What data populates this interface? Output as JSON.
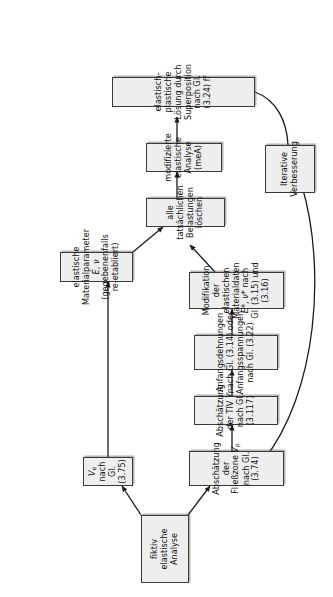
{
  "diagram": {
    "orientation": "rotated-90-ccw",
    "background_color": "#ffffff",
    "node_fill_color": "#eeeeee",
    "node_border_color": "#3a3a3a",
    "text_color": "#111111",
    "nodes": [
      {
        "id": "fiktiv-elastische-analyse",
        "label": "fiktiv elastische Analyse",
        "lines": [
          "fiktiv elastische Analyse"
        ]
      },
      {
        "id": "ve-nach-gl-375",
        "label": "Ve nach Gl. (3.75)",
        "lines": [
          "Ve nach Gl. (3.75)"
        ]
      },
      {
        "id": "abschaetzung-fliesszone",
        "label": "Abschätzung der Fließzone Vp nach Gl. (3.74)",
        "lines": [
          "Abschätzung der Fließzone Vp nach Gl. (3.74)"
        ]
      },
      {
        "id": "abschaetzung-tiv",
        "label": "Abschätzung der TIV Yi nach Gl. (3.117)",
        "lines": [
          "Abschätzung der TIV Yi nach Gl. (3.117)"
        ]
      },
      {
        "id": "anfangsdehnungen",
        "label": "Anfangsdehnungen nach Gl. (3.14) oder Anfangsspannungen nach Gl. (3.22)",
        "lines": [
          "Anfangsdehnungen nach Gl. (3.14) oder",
          "Anfangsspannungen nach Gl. (3.22)"
        ]
      },
      {
        "id": "modifikation-materialdaten",
        "label": "Modifikation der elastischen Materialdaten E*, ν* nach Gl. (3.15) und (3.16)",
        "lines": [
          "Modifikation der elastischen Materialdaten",
          "E*, ν* nach Gl. (3.15) und (3.16)"
        ]
      },
      {
        "id": "elastische-materialparameter",
        "label": "elastische Materialparameter E, ν (gegebenenfalls re-etabliert)",
        "lines": [
          "elastische Materialparameter E, ν",
          "(gegebenenfalls re-etabliert)"
        ]
      },
      {
        "id": "belastungen-loeschen",
        "label": "alle tatsächlichen Belastungen löschen",
        "lines": [
          "alle tatsächlichen Belastungen löschen"
        ]
      },
      {
        "id": "modifizierte-elastische-analyse",
        "label": "modifizierte elastische Analyse (meA)",
        "lines": [
          "modifizierte elastische Analyse (meA)"
        ]
      },
      {
        "id": "elastisch-plastische-loesung",
        "label": "elastisch-plastische Lösung durch Superposition nach Gl. (3.24) ff",
        "lines": [
          "elastisch-plastische Lösung durch Superposition nach Gl. (3.24) ff"
        ]
      },
      {
        "id": "iterative-verbesserung",
        "label": "Iterative Verbesserung",
        "lines": [
          "Iterative",
          "Verbesserung"
        ]
      }
    ],
    "edges": [
      {
        "from": "fiktiv-elastische-analyse",
        "to": "ve-nach-gl-375",
        "style": "arrow"
      },
      {
        "from": "fiktiv-elastische-analyse",
        "to": "abschaetzung-fliesszone",
        "style": "arrow"
      },
      {
        "from": "ve-nach-gl-375",
        "to": "elastische-materialparameter",
        "style": "arrow"
      },
      {
        "from": "abschaetzung-fliesszone",
        "to": "abschaetzung-tiv",
        "style": "arrow"
      },
      {
        "from": "abschaetzung-tiv",
        "to": "anfangsdehnungen",
        "style": "arrow"
      },
      {
        "from": "anfangsdehnungen",
        "to": "modifikation-materialdaten",
        "style": "arrow"
      },
      {
        "from": "modifikation-materialdaten",
        "to": "belastungen-loeschen",
        "style": "arrow"
      },
      {
        "from": "elastische-materialparameter",
        "to": "belastungen-loeschen",
        "style": "arrow"
      },
      {
        "from": "belastungen-loeschen",
        "to": "modifizierte-elastische-analyse",
        "style": "arrow"
      },
      {
        "from": "modifizierte-elastische-analyse",
        "to": "elastisch-plastische-loesung",
        "style": "arrow"
      },
      {
        "from": "elastisch-plastische-loesung",
        "to": "iterative-verbesserung",
        "style": "curve"
      },
      {
        "from": "iterative-verbesserung",
        "to": "abschaetzung-fliesszone",
        "style": "curve-arrow"
      }
    ]
  }
}
